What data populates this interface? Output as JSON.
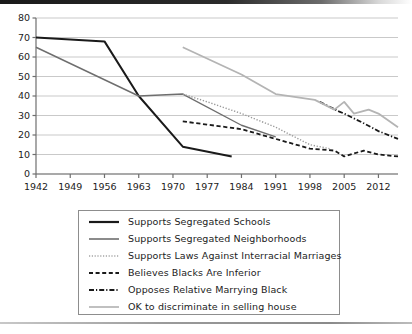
{
  "chart_data": {
    "type": "line",
    "title": "",
    "xlabel": "",
    "ylabel": "",
    "xlim": [
      1942,
      2016
    ],
    "ylim": [
      0,
      80
    ],
    "grid": true,
    "legend_position": "below-plot",
    "y_ticks": [
      0,
      10,
      20,
      30,
      40,
      50,
      60,
      70,
      80
    ],
    "x_ticks": [
      1942,
      1949,
      1956,
      1963,
      1970,
      1977,
      1984,
      1991,
      1998,
      2005,
      2012
    ],
    "series": [
      {
        "name": "Supports Segregated Schools",
        "style": "solid",
        "color": "#1a1a1a",
        "width": 2.0,
        "points": [
          [
            1942,
            70
          ],
          [
            1956,
            68
          ],
          [
            1963,
            40
          ],
          [
            1972,
            14
          ],
          [
            1982,
            9
          ]
        ]
      },
      {
        "name": "Supports Segregated Neighborhoods",
        "style": "solid",
        "color": "#6e6e6e",
        "width": 1.4,
        "points": [
          [
            1942,
            65
          ],
          [
            1963,
            40
          ],
          [
            1972,
            41
          ],
          [
            1984,
            25
          ],
          [
            1991,
            19
          ]
        ]
      },
      {
        "name": "Supports Laws Against Interracial Marriages",
        "style": "dotted",
        "color": "#9a9a9a",
        "width": 1.4,
        "points": [
          [
            1972,
            41
          ],
          [
            1977,
            37
          ],
          [
            1984,
            31
          ],
          [
            1991,
            24
          ],
          [
            1998,
            15
          ],
          [
            2002,
            13
          ]
        ]
      },
      {
        "name": "Believes Blacks Are Inferior",
        "style": "dashed",
        "color": "#1a1a1a",
        "width": 1.8,
        "points": [
          [
            1972,
            27
          ],
          [
            1984,
            23
          ],
          [
            1991,
            18
          ],
          [
            1998,
            13
          ],
          [
            2003,
            12
          ],
          [
            2005,
            9
          ],
          [
            2009,
            12
          ],
          [
            2012,
            10
          ],
          [
            2016,
            9
          ]
        ]
      },
      {
        "name": "Opposes Relative Marrying Black",
        "style": "dashdot",
        "color": "#1a1a1a",
        "width": 1.8,
        "points": [
          [
            2000,
            37
          ],
          [
            2004,
            32
          ],
          [
            2005,
            31
          ],
          [
            2009,
            26
          ],
          [
            2012,
            22
          ],
          [
            2016,
            18
          ]
        ]
      },
      {
        "name": "OK to discriminate in selling house",
        "style": "solid",
        "color": "#b4b4b4",
        "width": 1.8,
        "points": [
          [
            1972,
            65
          ],
          [
            1984,
            51
          ],
          [
            1991,
            41
          ],
          [
            1999,
            38
          ],
          [
            2003,
            33
          ],
          [
            2005,
            37
          ],
          [
            2007,
            31
          ],
          [
            2010,
            33
          ],
          [
            2012,
            31
          ],
          [
            2016,
            24
          ]
        ]
      }
    ]
  },
  "legend": {
    "items": [
      {
        "label": "Supports Segregated Schools",
        "swatch": "solid-black-line-icon"
      },
      {
        "label": "Supports Segregated Neighborhoods",
        "swatch": "solid-gray-line-icon"
      },
      {
        "label": "Supports Laws Against Interracial Marriages",
        "swatch": "dotted-line-icon"
      },
      {
        "label": "Believes Blacks Are Inferior",
        "swatch": "dashed-line-icon"
      },
      {
        "label": "Opposes Relative Marrying Black",
        "swatch": "dashdot-line-icon"
      },
      {
        "label": "OK to discriminate in selling house",
        "swatch": "solid-lightgray-line-icon"
      }
    ]
  },
  "colors": {
    "black": "#1a1a1a",
    "gray": "#6e6e6e",
    "light_gray": "#b4b4b4",
    "dotted_gray": "#9a9a9a",
    "grid": "#c9c9c9",
    "axis": "#6f6f6f"
  }
}
